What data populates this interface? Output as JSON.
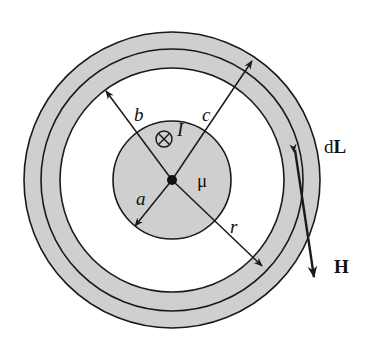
{
  "figure": {
    "colors": {
      "fill_gray": "#cfcfcf",
      "stroke": "#1a1a1a",
      "background": "#ffffff"
    },
    "geometry": {
      "center": [
        172,
        180
      ],
      "radius_a": 59,
      "radius_b": 112,
      "radius_path": 131,
      "radius_c": 148
    },
    "labels": {
      "a": "a",
      "b": "b",
      "c": "c",
      "r": "r",
      "current": "I",
      "permeability": "μ",
      "dL_d": "d",
      "dL_L": "L",
      "H": "H"
    },
    "symbols": {
      "current_direction": "into-page (⊗)"
    }
  }
}
